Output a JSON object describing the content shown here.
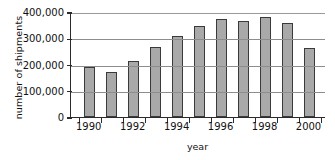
{
  "chart_data": {
    "type": "bar",
    "title": "",
    "xlabel": "year",
    "ylabel": "number of shipments",
    "categories": [
      1990,
      1991,
      1992,
      1993,
      1994,
      1995,
      1996,
      1997,
      1998,
      1999,
      2000
    ],
    "values": [
      190000,
      172000,
      212000,
      265000,
      307000,
      347000,
      372000,
      365000,
      380000,
      360000,
      262000
    ],
    "ylim": [
      0,
      400000
    ],
    "ytick_values": [
      0,
      100000,
      200000,
      300000,
      400000
    ],
    "ytick_labels": [
      "0",
      "100,000",
      "200,000",
      "300,000",
      "400,000"
    ],
    "xtick_labels": [
      "1990",
      "1992",
      "1994",
      "1996",
      "1998",
      "2000"
    ],
    "xtick_categories": [
      1990,
      1992,
      1994,
      1996,
      1998,
      2000
    ],
    "grid": true,
    "grid_axis": "y",
    "legend": "none",
    "bar_fill_color": "#a9a9a9",
    "bar_edge_color": "#3a3a3a",
    "axis_color": "#2b2b2b",
    "grid_color": "#8d8d8d",
    "background_color": "#ffffff"
  }
}
